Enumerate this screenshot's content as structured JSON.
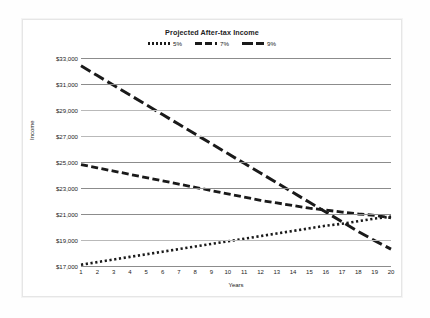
{
  "chart_data": {
    "type": "line",
    "title": "Projected After-tax Income",
    "xlabel": "Years",
    "ylabel": "Income",
    "grid": true,
    "legend_position": "top-center",
    "xlim": [
      1,
      20
    ],
    "ylim": [
      17000,
      33000
    ],
    "ytick_step": 2000,
    "x": [
      1,
      2,
      3,
      4,
      5,
      6,
      7,
      8,
      9,
      10,
      11,
      12,
      13,
      14,
      15,
      16,
      17,
      18,
      19,
      20
    ],
    "xticklabels": [
      "1",
      "2",
      "3",
      "4",
      "5",
      "6",
      "7",
      "8",
      "9",
      "10",
      "11",
      "12",
      "13",
      "14",
      "15",
      "16",
      "17",
      "18",
      "19",
      "20"
    ],
    "yticklabels": [
      "$33,000",
      "$31,000",
      "$29,000",
      "$27,000",
      "$25,000",
      "$23,000",
      "$21,000",
      "$19,000",
      "$17,000"
    ],
    "series": [
      {
        "name": "5%",
        "style": "dotted",
        "color": "#1a1a1a",
        "values": [
          17100,
          17300,
          17500,
          17700,
          17900,
          18100,
          18300,
          18500,
          18700,
          18900,
          19100,
          19300,
          19500,
          19700,
          19900,
          20100,
          20250,
          20450,
          20650,
          20800
        ]
      },
      {
        "name": "7%",
        "style": "dashed",
        "color": "#1a1a1a",
        "values": [
          24800,
          24550,
          24300,
          24050,
          23800,
          23550,
          23300,
          23050,
          22800,
          22550,
          22300,
          22050,
          21850,
          21650,
          21450,
          21300,
          21150,
          21000,
          20900,
          20700
        ]
      },
      {
        "name": "9%",
        "style": "long-dash",
        "color": "#1a1a1a",
        "values": [
          32400,
          31650,
          30900,
          30150,
          29400,
          28650,
          27900,
          27150,
          26400,
          25650,
          24900,
          24150,
          23400,
          22650,
          21900,
          21150,
          20400,
          19650,
          18950,
          18300
        ]
      }
    ]
  },
  "chart": {
    "title": "Projected After-tax Income",
    "xlabel": "Years",
    "ylabel": "Income"
  }
}
